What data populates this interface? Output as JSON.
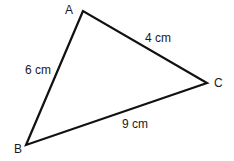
{
  "diagram": {
    "type": "triangle",
    "stroke_color": "#111111",
    "stroke_width": 2.2,
    "vertices": [
      {
        "name": "A",
        "x": 83,
        "y": 11
      },
      {
        "name": "B",
        "x": 26,
        "y": 145
      },
      {
        "name": "C",
        "x": 207,
        "y": 83
      }
    ],
    "vertex_labels": {
      "A": "A",
      "B": "B",
      "C": "C"
    },
    "sides": [
      {
        "from": "A",
        "to": "B",
        "label": "6 cm"
      },
      {
        "from": "A",
        "to": "C",
        "label": "4 cm"
      },
      {
        "from": "B",
        "to": "C",
        "label": "9 cm"
      }
    ],
    "side_labels": {
      "AB": "6 cm",
      "AC": "4 cm",
      "BC": "9 cm"
    }
  }
}
